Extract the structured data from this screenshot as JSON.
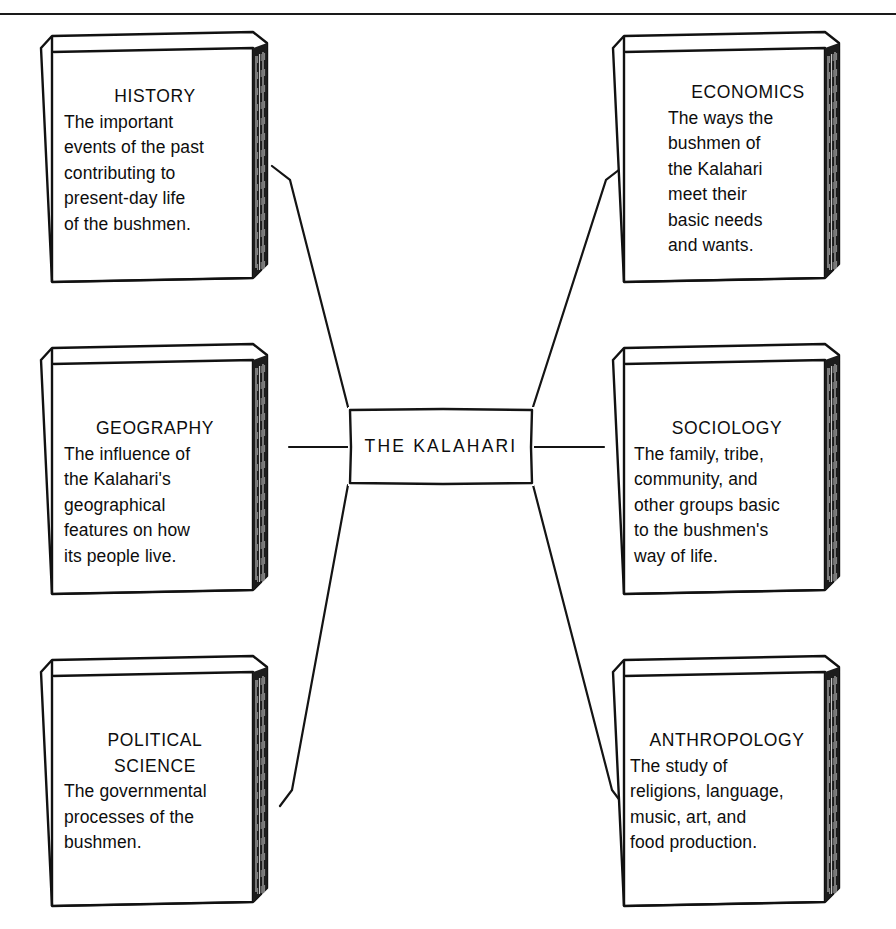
{
  "diagram": {
    "type": "concept-map",
    "center": {
      "label": "THE  KALAHARI"
    },
    "books": [
      {
        "id": "history",
        "title": "HISTORY",
        "body": "The important\nevents of the past\ncontributing to\npresent-day life\nof the bushmen."
      },
      {
        "id": "economics",
        "title": "ECONOMICS",
        "body": "The ways the\nbushmen of\nthe Kalahari\nmeet their\nbasic needs\nand wants."
      },
      {
        "id": "geography",
        "title": "GEOGRAPHY",
        "body": "The influence of\nthe Kalahari's\ngeographical\nfeatures on how\nits people live."
      },
      {
        "id": "sociology",
        "title": "SOCIOLOGY",
        "body": "The family, tribe,\ncommunity, and\nother groups basic\nto the bushmen's\nway of life."
      },
      {
        "id": "political-science",
        "title": "POLITICAL\nSCIENCE",
        "body": "The governmental\nprocesses of the\nbushmen."
      },
      {
        "id": "anthropology",
        "title": "ANTHROPOLOGY",
        "body": "The study of\nreligions, language,\nmusic, art, and\nfood production."
      }
    ],
    "colors": {
      "ink": "#111111",
      "paper": "#ffffff"
    }
  }
}
